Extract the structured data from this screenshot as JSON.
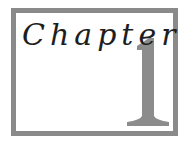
{
  "heading": {
    "label": "Chapter",
    "number": "1"
  },
  "colors": {
    "frame": "#8a8a8a",
    "numeral": "#8c8c8c",
    "text": "#1e1e1e",
    "background": "#ffffff"
  }
}
